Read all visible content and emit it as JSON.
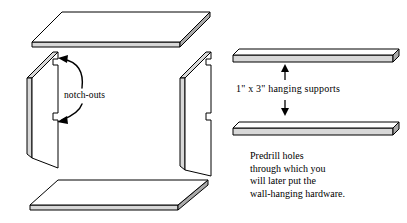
{
  "figure": {
    "background_color": "#ffffff",
    "line_color": "#000000",
    "edge_shade_color": "#d8d8d8"
  },
  "annotations": {
    "notch_label": "notch-outs",
    "supports_label": "1\" x 3\" hanging supports",
    "predrill_note_lines": [
      "Predrill holes",
      "through which you",
      "will later put the",
      "wall-hanging hardware."
    ]
  },
  "parts": {
    "top_panel": "top shelf panel",
    "bottom_panel": "bottom shelf panel",
    "left_side_panel": "left side panel with notch-outs",
    "right_side_panel": "right side panel with notch-outs",
    "upper_support": "upper 1 by 3 hanging support",
    "lower_support": "lower 1 by 3 hanging support"
  },
  "icons": {
    "up_arrow": "arrow-up-icon",
    "down_arrow": "arrow-down-icon",
    "callout_upper": "curved-arrow-upper-icon",
    "callout_lower": "curved-arrow-lower-icon"
  }
}
